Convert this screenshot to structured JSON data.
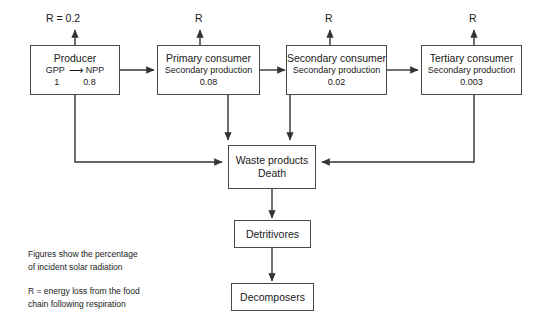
{
  "diagram": {
    "line_color": "#333333",
    "box_border_color": "#4a4a4a",
    "background": "#ffffff",
    "nodes": {
      "producer": {
        "title": "Producer",
        "gpp_label": "GPP",
        "arrow_glyph": "⟶",
        "npp_label": "NPP",
        "gpp_value": "1",
        "npp_value": "0.8"
      },
      "primary_consumer": {
        "title": "Primary consumer",
        "sub": "Secondary production",
        "value": "0.08"
      },
      "secondary_consumer": {
        "title": "Secondary consumer",
        "sub": "Secondary production",
        "value": "0.02"
      },
      "tertiary_consumer": {
        "title": "Tertiary consumer",
        "sub": "Secondary production",
        "value": "0.003"
      },
      "waste": {
        "line1": "Waste products",
        "line2": "Death"
      },
      "detritivores": {
        "title": "Detritivores"
      },
      "decomposers": {
        "title": "Decomposers"
      }
    },
    "respiration_labels": {
      "producer": "R = 0.2",
      "primary_consumer": "R",
      "secondary_consumer": "R",
      "tertiary_consumer": "R"
    },
    "legend": {
      "figures_line1": "Figures show the percentage",
      "figures_line2": "of incident solar radiation",
      "respiration_line1": "R = energy loss from the food",
      "respiration_line2": "chain following respiration"
    }
  }
}
